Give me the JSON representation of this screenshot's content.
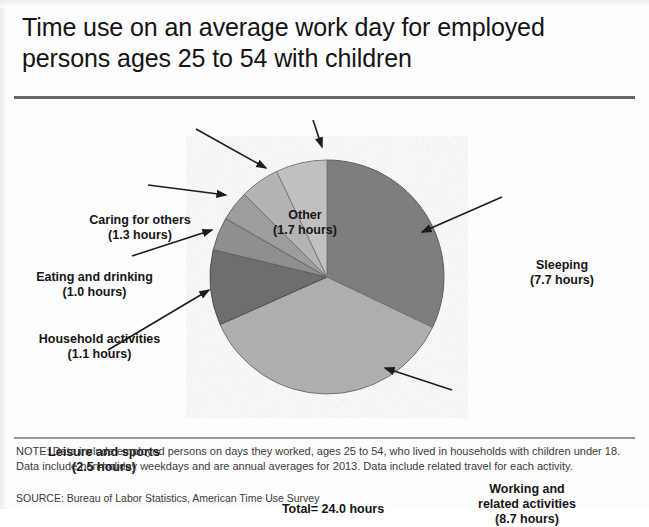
{
  "title": "Time use on an average work day for employed persons ages 25 to 54 with children",
  "total_label": "Total= 24.0 hours",
  "note": "NOTE: Data include employed persons on days they worked, ages 25 to 54, who lived in households with children under 18. Data include non-holiday weekdays and are annual averages for 2013. Data include related travel for each activity.",
  "source": "SOURCE: Bureau of Labor Statistics, American Time Use Survey",
  "labels": {
    "sleeping": {
      "name": "Sleeping",
      "value": "(7.7 hours)"
    },
    "working": {
      "name": "Working and",
      "name2": "related activities",
      "value": "(8.7 hours)"
    },
    "leisure": {
      "name": "Leisure and sports",
      "value": "(2.5 hours)"
    },
    "household": {
      "name": "Household activities",
      "value": "(1.1 hours)"
    },
    "eating": {
      "name": "Eating and drinking",
      "value": "(1.0 hours)"
    },
    "caring": {
      "name": "Caring for others",
      "value": "(1.3 hours)"
    },
    "other": {
      "name": "Other",
      "value": "(1.7 hours)"
    }
  },
  "chart_data": {
    "type": "pie",
    "title": "Time use on an average work day for employed persons ages 25 to 54 with children",
    "unit": "hours",
    "total": 24.0,
    "total_text": "Total= 24.0 hours",
    "start_angle_deg": -90,
    "direction": "clockwise",
    "center": {
      "x": 327,
      "y": 277
    },
    "radius": 117,
    "categories": [
      "Sleeping",
      "Working and related activities",
      "Leisure and sports",
      "Household activities",
      "Eating and drinking",
      "Caring for others",
      "Other"
    ],
    "values": [
      7.7,
      8.7,
      2.5,
      1.1,
      1.0,
      1.3,
      1.7
    ],
    "percentages": [
      32.1,
      36.3,
      10.4,
      4.6,
      4.2,
      5.4,
      7.1
    ],
    "colors": [
      "#7e7e7e",
      "#aeaeae",
      "#6e6e6e",
      "#8f8f8f",
      "#9d9d9d",
      "#b4b4b4",
      "#c0c0c0"
    ],
    "legend": "none",
    "labels_style": "callout-with-arrow",
    "grid": false
  }
}
